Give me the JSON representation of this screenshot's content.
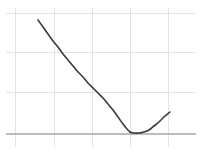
{
  "figure": {
    "width": 202,
    "height": 157,
    "background_color": "#ffffff",
    "title": "",
    "subtitle": ""
  },
  "style": {
    "grid_color": "#e3e3e3",
    "axis_color": "#a6a6a6",
    "curve_color": "#3a3a3a",
    "grid_width": 1,
    "axis_width": 1.4,
    "curve_width": 1.6
  },
  "grid": {
    "vertical_px": [
      15,
      54,
      92,
      130,
      168
    ],
    "vertical_span_px": [
      8,
      147
    ],
    "horizontal_px": [
      13,
      52,
      92
    ],
    "horizontal_span_px": [
      6,
      196
    ],
    "axis_y_px": 134,
    "axis_span_px": [
      6,
      196
    ]
  },
  "chart_data": {
    "type": "line",
    "title": "",
    "subtitle": "",
    "xlabel": "",
    "ylabel": "",
    "xlim": [
      0,
      5
    ],
    "ylim": [
      0,
      3
    ],
    "grid": true,
    "legend": null,
    "xticks": [
      0,
      1,
      2,
      3,
      4
    ],
    "xticklabels": [
      "",
      "",
      "",
      "",
      ""
    ],
    "yticks": [
      0,
      1,
      2,
      3
    ],
    "yticklabels": [
      "",
      "",
      "",
      ""
    ],
    "annotations": [],
    "series": [
      {
        "name": "curve",
        "color": "#3a3a3a",
        "linewidth": 1.6,
        "marker": "none",
        "x": [
          0.6,
          0.8,
          1.0,
          1.2,
          1.4,
          1.6,
          1.8,
          2.0,
          2.2,
          2.4,
          2.6,
          2.8,
          3.0,
          3.2,
          3.4,
          3.6,
          3.8,
          4.0
        ],
        "y": [
          2.98,
          2.72,
          2.46,
          2.21,
          1.97,
          1.74,
          1.52,
          1.31,
          1.11,
          0.92,
          0.74,
          0.57,
          0.41,
          0.27,
          0.14,
          0.05,
          0.02,
          0.07
        ],
        "points_px": [
          [
            38,
            20
          ],
          [
            43,
            27
          ],
          [
            48,
            34
          ],
          [
            53,
            41
          ],
          [
            58,
            47
          ],
          [
            63,
            54
          ],
          [
            68,
            60
          ],
          [
            73,
            66
          ],
          [
            78,
            72
          ],
          [
            83,
            77
          ],
          [
            88,
            83
          ],
          [
            93,
            88
          ],
          [
            98,
            93
          ],
          [
            103,
            98
          ],
          [
            108,
            104
          ],
          [
            113,
            110
          ],
          [
            118,
            117
          ],
          [
            123,
            124
          ],
          [
            127,
            129
          ],
          [
            130,
            132
          ],
          [
            134,
            133
          ],
          [
            139,
            133
          ],
          [
            144,
            132
          ],
          [
            149,
            130
          ],
          [
            154,
            126
          ],
          [
            159,
            122
          ],
          [
            164,
            117
          ],
          [
            170,
            112
          ]
        ]
      }
    ],
    "minimum_px": [
      133,
      133
    ],
    "minimum_value": [
      3.75,
      0.0
    ],
    "start_px": [
      38,
      20
    ],
    "end_px": [
      170,
      112
    ]
  }
}
